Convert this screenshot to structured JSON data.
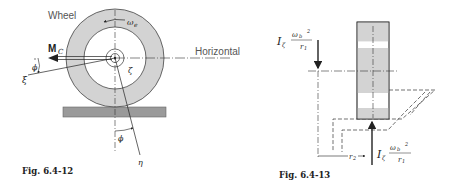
{
  "figures": [
    {
      "id": "fig-6-4-12",
      "caption": "Fig. 6.4-12",
      "labels": {
        "wheel": "Wheel",
        "horizontal": "Horizontal",
        "moment": "M",
        "moment_sub": "C",
        "omega": "ω",
        "omega_sub": "e",
        "phi_left": "ϕ",
        "phi_bottom": "ϕ",
        "xi": "ξ",
        "zeta": "ζ",
        "eta": "η"
      }
    },
    {
      "id": "fig-6-4-13",
      "caption": "Fig. 6.4-13",
      "labels": {
        "force_top_I": "I",
        "force_top_I_sub": "ζ",
        "force_top_num": "ω",
        "force_top_num_sub": "b",
        "force_top_num_sup": "2",
        "force_top_den": "r",
        "force_top_den_sub": "1",
        "force_bottom_I": "I",
        "force_bottom_I_sub": "ζ",
        "force_bottom_num": "ω",
        "force_bottom_num_sub": "b",
        "force_bottom_num_sup": "2",
        "force_bottom_den": "r",
        "force_bottom_den_sub": "1",
        "r2": "r",
        "r2_sub": "2"
      }
    }
  ],
  "colors": {
    "wheel_fill": "#d3d3d3",
    "ground_fill": "#9a9a9a",
    "line": "#222222",
    "text_gray": "#555555"
  }
}
